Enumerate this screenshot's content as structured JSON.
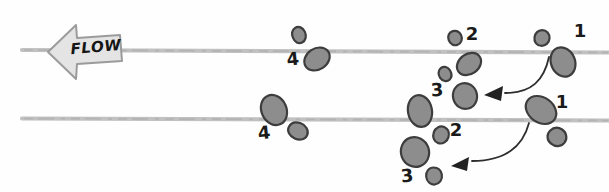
{
  "diagram": {
    "flow": {
      "label": "FLOW",
      "direction": "left"
    },
    "rows": {
      "top": {
        "steps": [
          {
            "label": "1"
          },
          {
            "label": "2"
          },
          {
            "label": "3"
          },
          {
            "label": "4"
          }
        ]
      },
      "bottom": {
        "steps": [
          {
            "label": "1"
          },
          {
            "label": "2"
          },
          {
            "label": "3"
          },
          {
            "label": "4"
          }
        ]
      }
    },
    "colors": {
      "background": "#fefefe",
      "cell_fill": "#8d8d8d",
      "cell_outline": "#3d3d3d",
      "flow_line": "#c1c1c1",
      "flow_arrow_fill": "#e4e4e4",
      "flow_arrow_outline": "#9b9b9b",
      "transition_arrow": "#2e2e2e",
      "label_text": "#1a1a1a"
    }
  }
}
